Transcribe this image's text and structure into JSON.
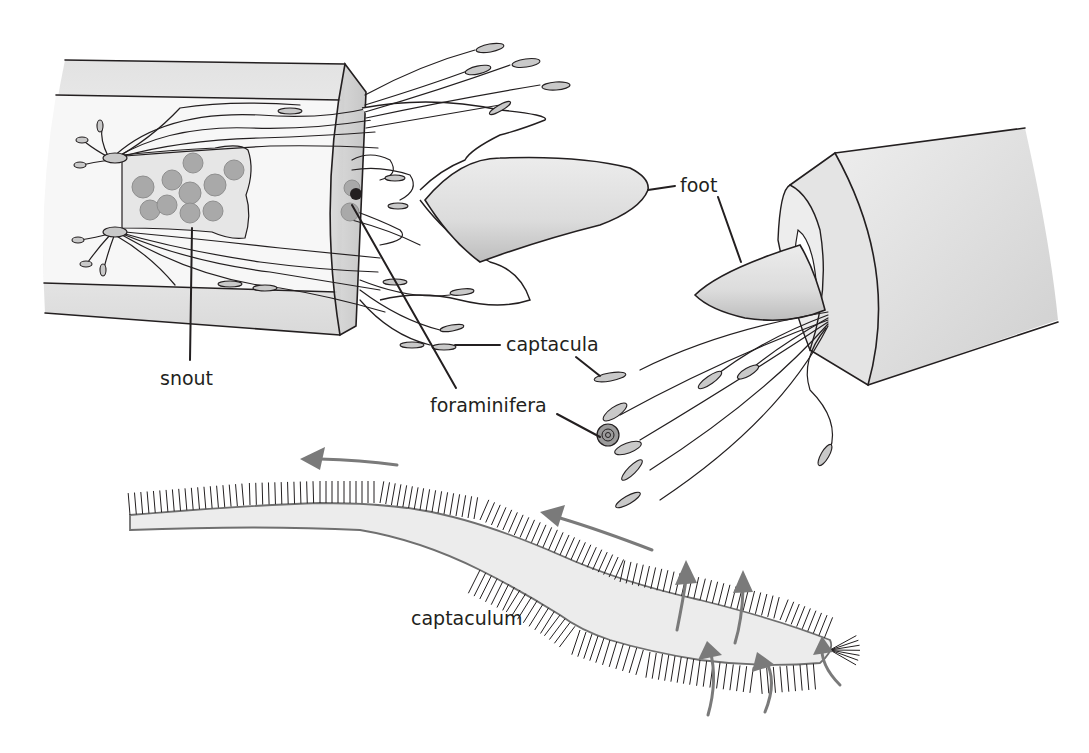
{
  "figure": {
    "labels": {
      "snout": "snout",
      "foot": "foot",
      "captacula": "captacula",
      "foraminifera": "foraminifera",
      "captaculum": "captaculum"
    },
    "colors": {
      "outline": "#231f20",
      "shell_fill": "#e6e6e6",
      "tip_fill": "#c9c9c9",
      "flow_arrow": "#7a7a7a",
      "foraminifera": "#a9a9a9"
    },
    "panels": [
      {
        "id": "left-shell",
        "description": "Cut-away shell showing snout, captacula and extended foot"
      },
      {
        "id": "right-shell",
        "description": "Shell aperture with foot and captacula capturing foraminifera"
      },
      {
        "id": "captaculum-detail",
        "description": "Single captaculum with cilia and water flow arrows"
      }
    ]
  }
}
